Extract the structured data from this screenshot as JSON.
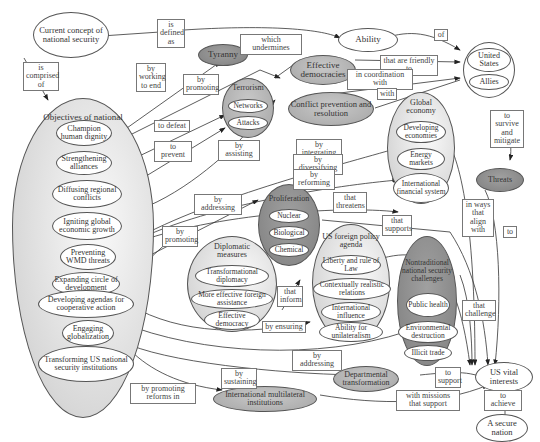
{
  "nodes": {
    "current_concept": "Current concept of national security",
    "ability": "Ability",
    "us_allies_group": {
      "united_states": "United States",
      "allies": "Allies"
    },
    "tyranny": "Tyranny",
    "effective_democracies": "Effective democracies",
    "terrorism": {
      "title": "Terrorism",
      "networks": "Networks",
      "attacks": "Attacks"
    },
    "conflict_prevention": "Conflict prevention and resolution",
    "global_economy": {
      "title": "Global economy",
      "items": [
        "Developing economies",
        "Energy markets",
        "International financial system"
      ]
    },
    "threats": "Threats",
    "objectives": {
      "title": "Objectives of national security",
      "items": [
        "Champion human dignity",
        "Strengthening alliances",
        "Diffusing regional conflicts",
        "Igniting global economic growth",
        "Preventing WMD threats",
        "Expanding circle of development",
        "Developing agendas for cooperative action",
        "Engaging globalization",
        "Transforming US national security institutions"
      ]
    },
    "proliferation": {
      "title": "Proliferation",
      "items": [
        "Nuclear",
        "Biological",
        "Chemical"
      ]
    },
    "diplomatic": {
      "title": "Diplomatic measures",
      "items": [
        "Transformational diplomacy",
        "More effective foreign assistance",
        "Effective democracy"
      ]
    },
    "us_foreign_policy": {
      "title": "US foreign policy agenda",
      "items": [
        "Liberty and rule of Law",
        "Contextually realistic relations",
        "International influence",
        "Ability for unilateralism"
      ]
    },
    "nontraditional": {
      "title": "Nontraditional national security challenges",
      "items": [
        "Public health",
        "Environmental destruction",
        "Illicit trade"
      ]
    },
    "us_vital_interests": "US vital interests",
    "secure_nation": "A secure nation",
    "departmental": "Departmental transformation",
    "intl_multilateral": "International multilateral institutions"
  },
  "edge_labels": {
    "is_defined_as": "is defined as",
    "is_comprised_of": "is comprised of",
    "which_undermines": "which undermines",
    "of": "of",
    "by_working_to_end": "by working to end",
    "by_promoting_1": "by promoting",
    "that_are_friendly_to": "that are friendly to",
    "in_coordination_with": "in coordination with",
    "with": "with",
    "to_defeat": "to defeat",
    "to_prevent": "to prevent",
    "by_assisting": "by assisting",
    "by_integrating": "by integrating",
    "by_diversifying": "by diversifying",
    "by_reforming": "by reforming",
    "to_survive_and_mitigate": "to survive and mitigate",
    "by_addressing_1": "by addressing",
    "that_threatens": "that threatens",
    "by_promoting_2": "by promoting",
    "in_ways_that_align_with": "in ways that align with",
    "that_supports": "that supports",
    "to": "to",
    "that_inform": "that inform",
    "that_challenge": "that challenge",
    "by_ensuring": "by ensuring",
    "by_addressing_2": "by addressing",
    "to_achieve": "to achieve",
    "by_sustaining": "by sustaining",
    "to_support": "to support",
    "by_promoting_reforms_in": "by promoting reforms in",
    "with_missions_that_support": "with missions that support"
  }
}
